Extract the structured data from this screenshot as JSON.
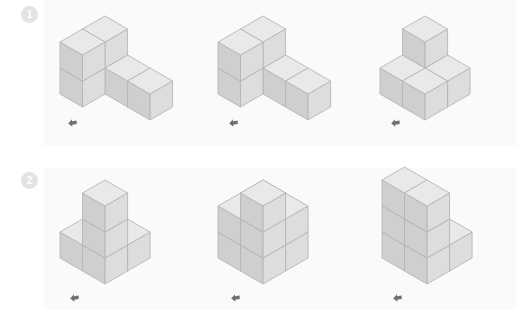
{
  "page": {
    "background_color": "#ffffff",
    "panel_color": "#fafafa",
    "rows": 2,
    "figures_per_row": 3
  },
  "colors": {
    "cube_top": "#e9e9e9",
    "cube_left": "#cfcfcf",
    "cube_right": "#dddddd",
    "cube_edge": "#b6b6b6",
    "badge_bg": "#e3e3e3",
    "badge_text": "#ffffff",
    "marker": "#707070",
    "panel": "#fafafa"
  },
  "rows": [
    {
      "id": "row-1",
      "badge": {
        "label": "1",
        "icon": "circled-number-icon"
      },
      "figures": [
        {
          "id": "figure-1-1",
          "name": "cube-figure-1-1",
          "marker_icon": "arrow-marker-icon",
          "cube_count": 6,
          "cubes": [
            {
              "x": 0,
              "y": 0,
              "z": 0
            },
            {
              "x": 1,
              "y": 0,
              "z": 0
            },
            {
              "x": 2,
              "y": 0,
              "z": 0
            },
            {
              "x": 0,
              "y": 1,
              "z": 0
            },
            {
              "x": 0,
              "y": 0,
              "z": 1
            },
            {
              "x": 0,
              "y": 1,
              "z": 1
            }
          ]
        },
        {
          "id": "figure-1-2",
          "name": "cube-figure-1-2",
          "marker_icon": "arrow-marker-icon",
          "cube_count": 6,
          "cubes": [
            {
              "x": 0,
              "y": 0,
              "z": 0
            },
            {
              "x": 1,
              "y": 0,
              "z": 0
            },
            {
              "x": 2,
              "y": 0,
              "z": 0
            },
            {
              "x": 0,
              "y": 1,
              "z": 0
            },
            {
              "x": 0,
              "y": 0,
              "z": 1
            },
            {
              "x": 0,
              "y": 1,
              "z": 1
            }
          ]
        },
        {
          "id": "figure-1-3",
          "name": "cube-figure-1-3",
          "marker_icon": "arrow-marker-icon",
          "cube_count": 5,
          "cubes": [
            {
              "x": 0,
              "y": 0,
              "z": 0
            },
            {
              "x": 1,
              "y": 0,
              "z": 0
            },
            {
              "x": 1,
              "y": 1,
              "z": 0
            },
            {
              "x": 0,
              "y": 1,
              "z": 0
            },
            {
              "x": 0,
              "y": 0,
              "z": 1
            }
          ]
        }
      ]
    },
    {
      "id": "row-2",
      "badge": {
        "label": "2",
        "icon": "circled-number-icon"
      },
      "figures": [
        {
          "id": "figure-2-1",
          "name": "cube-figure-2-1",
          "marker_icon": "arrow-marker-icon",
          "cube_count": 6,
          "cubes": [
            {
              "x": 0,
              "y": 0,
              "z": 0
            },
            {
              "x": 1,
              "y": 0,
              "z": 0
            },
            {
              "x": 0,
              "y": 1,
              "z": 0
            },
            {
              "x": 1,
              "y": 1,
              "z": 0
            },
            {
              "x": 1,
              "y": 1,
              "z": 1
            },
            {
              "x": 1,
              "y": 1,
              "z": 2
            }
          ]
        },
        {
          "id": "figure-2-2",
          "name": "cube-figure-2-2",
          "marker_icon": "arrow-marker-icon",
          "cube_count": 9,
          "cubes": [
            {
              "x": 0,
              "y": 0,
              "z": 0
            },
            {
              "x": 1,
              "y": 0,
              "z": 0
            },
            {
              "x": 0,
              "y": 1,
              "z": 0
            },
            {
              "x": 1,
              "y": 1,
              "z": 0
            },
            {
              "x": 0,
              "y": 0,
              "z": 1
            },
            {
              "x": 1,
              "y": 0,
              "z": 1
            },
            {
              "x": 0,
              "y": 1,
              "z": 1
            },
            {
              "x": 1,
              "y": 1,
              "z": 1
            },
            {
              "x": 1,
              "y": 1,
              "z": 2
            }
          ]
        },
        {
          "id": "figure-2-3",
          "name": "cube-figure-2-3",
          "marker_icon": "arrow-marker-icon",
          "cube_count": 8,
          "cubes": [
            {
              "x": 0,
              "y": 0,
              "z": 0
            },
            {
              "x": 1,
              "y": 0,
              "z": 0
            },
            {
              "x": 0,
              "y": 1,
              "z": 0
            },
            {
              "x": 1,
              "y": 1,
              "z": 0
            },
            {
              "x": 0,
              "y": 1,
              "z": 1
            },
            {
              "x": 1,
              "y": 1,
              "z": 1
            },
            {
              "x": 0,
              "y": 1,
              "z": 2
            },
            {
              "x": 1,
              "y": 1,
              "z": 2
            }
          ]
        }
      ]
    }
  ],
  "layout": {
    "cube_size": 26,
    "figure_offsets": [
      {
        "left": 58,
        "top": 18
      },
      {
        "left": 216,
        "top": 18
      },
      {
        "left": 378,
        "top": 18
      }
    ],
    "figure_offsets_row2": [
      {
        "left": 58,
        "top": 12
      },
      {
        "left": 216,
        "top": 12
      },
      {
        "left": 380,
        "top": 12
      }
    ],
    "marker_positions": [
      {
        "left": 67,
        "top": 118
      },
      {
        "left": 228,
        "top": 118
      },
      {
        "left": 390,
        "top": 118
      }
    ],
    "marker_positions_row2": [
      {
        "left": 69,
        "top": 293
      },
      {
        "left": 230,
        "top": 293
      },
      {
        "left": 392,
        "top": 293
      }
    ]
  }
}
